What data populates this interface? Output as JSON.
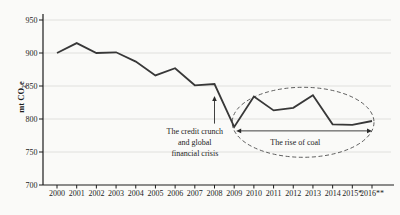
{
  "chart_data": {
    "type": "line",
    "title": "",
    "xlabel": "",
    "ylabel": "mt CO2e",
    "ylabel_parts": {
      "pre": "mt CO",
      "sub": "2",
      "post": "e"
    },
    "categories": [
      "2000",
      "2001",
      "2002",
      "2003",
      "2004",
      "2005",
      "2006",
      "2007",
      "2008",
      "2009",
      "2010",
      "2011",
      "2012",
      "2013",
      "2014",
      "2015*",
      "2016**"
    ],
    "series": [
      {
        "name": "emissions",
        "values": [
          900,
          915,
          900,
          901,
          887,
          866,
          877,
          851,
          853,
          788,
          834,
          813,
          817,
          836,
          792,
          791,
          797
        ]
      }
    ],
    "ylim": [
      700,
      950
    ],
    "yticks": [
      700,
      750,
      800,
      850,
      900,
      950
    ],
    "grid": true,
    "legend": false,
    "annotations": {
      "crisis": {
        "text_lines": [
          "The credit crunch",
          "and global",
          "financial crisis"
        ],
        "anchor_year": "2007",
        "text_top_value": 781,
        "line_height": 10.7,
        "arrow_year": "2008",
        "arrow_from_value": 793,
        "arrow_to_value": 835
      },
      "coal": {
        "label": "The rise of coal",
        "from_year": "2009",
        "to_year": "2016",
        "arrow_value": 782,
        "label_center_year": "2012",
        "label_value": 765,
        "ellipse": {
          "from_year": "2009",
          "to_year": "2016",
          "pad_x": 2,
          "top_value": 848,
          "bottom_value": 742
        }
      }
    },
    "colors": {
      "background": "#fafaf8",
      "line": "#383838",
      "axis": "#1c1c1c",
      "grid": "#d9d9d6",
      "text": "#1c1c1c",
      "annotation": "#2b2b2b",
      "ellipse": "#4d4d4d"
    }
  }
}
